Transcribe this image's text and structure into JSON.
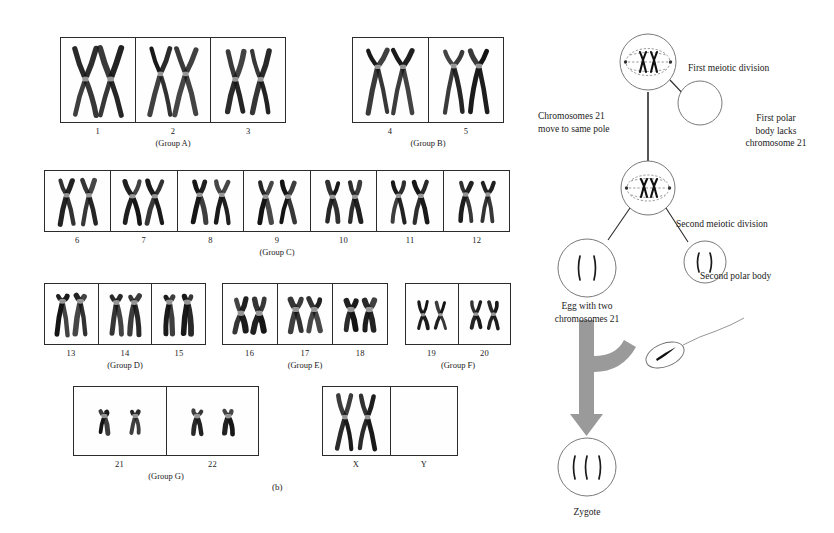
{
  "figure": {
    "panel_letter": "(b)",
    "accent_arrow_color": "#9a9a9a",
    "line_color": "#2b2b2b",
    "chromosome_color": "#111111"
  },
  "karyotype": {
    "rows": [
      {
        "name": "row-a-b",
        "groups": [
          {
            "id": "group-a",
            "label": "(Group A)",
            "x": 60,
            "y": 37,
            "width": 226,
            "height": 86,
            "cells": [
              {
                "number": "1",
                "pair": "A1"
              },
              {
                "number": "2",
                "pair": "A2"
              },
              {
                "number": "3",
                "pair": "A3"
              }
            ]
          },
          {
            "id": "group-b",
            "label": "(Group B)",
            "x": 352,
            "y": 37,
            "width": 152,
            "height": 86,
            "cells": [
              {
                "number": "4",
                "pair": "B4"
              },
              {
                "number": "5",
                "pair": "B5"
              }
            ]
          }
        ]
      },
      {
        "name": "row-c",
        "groups": [
          {
            "id": "group-c",
            "label": "(Group C)",
            "x": 44,
            "y": 170,
            "width": 466,
            "height": 62,
            "cells": [
              {
                "number": "6",
                "pair": "C6"
              },
              {
                "number": "7",
                "pair": "C7"
              },
              {
                "number": "8",
                "pair": "C8"
              },
              {
                "number": "9",
                "pair": "C9"
              },
              {
                "number": "10",
                "pair": "C10"
              },
              {
                "number": "11",
                "pair": "C11"
              },
              {
                "number": "12",
                "pair": "C12"
              }
            ]
          }
        ]
      },
      {
        "name": "row-d-e-f",
        "groups": [
          {
            "id": "group-d",
            "label": "(Group D)",
            "x": 44,
            "y": 283,
            "width": 162,
            "height": 62,
            "cells": [
              {
                "number": "13",
                "pair": "D13"
              },
              {
                "number": "14",
                "pair": "D14"
              },
              {
                "number": "15",
                "pair": "D15"
              }
            ]
          },
          {
            "id": "group-e",
            "label": "(Group E)",
            "x": 222,
            "y": 283,
            "width": 166,
            "height": 62,
            "cells": [
              {
                "number": "16",
                "pair": "E16"
              },
              {
                "number": "17",
                "pair": "E17"
              },
              {
                "number": "18",
                "pair": "E18"
              }
            ]
          },
          {
            "id": "group-f",
            "label": "(Group F)",
            "x": 405,
            "y": 283,
            "width": 106,
            "height": 62,
            "cells": [
              {
                "number": "19",
                "pair": "F19"
              },
              {
                "number": "20",
                "pair": "F20"
              }
            ]
          }
        ]
      },
      {
        "name": "row-g-sex",
        "groups": [
          {
            "id": "group-g",
            "label": "(Group G)",
            "x": 73,
            "y": 386,
            "width": 186,
            "height": 70,
            "cells": [
              {
                "number": "21",
                "pair": "G21"
              },
              {
                "number": "22",
                "pair": "G22"
              }
            ]
          },
          {
            "id": "group-sex",
            "label": "",
            "x": 322,
            "y": 386,
            "width": 136,
            "height": 70,
            "cells": [
              {
                "number": "X",
                "pair": "SEXX"
              },
              {
                "number": "Y",
                "pair": "SEXY"
              }
            ]
          }
        ]
      }
    ]
  },
  "meiosis": {
    "labels": {
      "first_meiotic_division": "First meiotic division",
      "chromosomes_move": "Chromosomes 21\nmove to same pole",
      "first_polar_body": "First polar\nbody lacks\nchromosome 21",
      "second_meiotic_division": "Second meiotic division",
      "second_polar_body": "Second polar body",
      "egg_with_two": "Egg with two\nchromosomes 21",
      "zygote": "Zygote"
    },
    "cells": {
      "first_division_cell": {
        "cx": 128,
        "cy": 62,
        "r": 28
      },
      "first_polar_body": {
        "cx": 180,
        "cy": 103,
        "r": 22
      },
      "second_division_cell": {
        "cx": 128,
        "cy": 188,
        "r": 27
      },
      "egg_cell": {
        "cx": 67,
        "cy": 268,
        "r": 29
      },
      "second_polar_body_cell": {
        "cx": 185,
        "cy": 262,
        "r": 21
      },
      "zygote_cell": {
        "cx": 67,
        "cy": 467,
        "r": 29
      },
      "sperm_head": {
        "cx": 145,
        "cy": 355,
        "rx": 20,
        "ry": 11
      }
    }
  }
}
